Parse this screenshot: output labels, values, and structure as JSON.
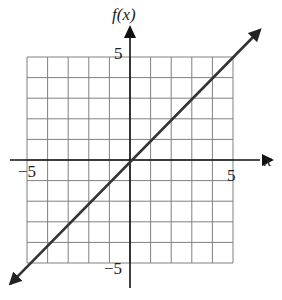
{
  "chart_data": {
    "type": "line",
    "title": "",
    "xlabel": "x",
    "ylabel": "f(x)",
    "xlim": [
      -5,
      5
    ],
    "ylim": [
      -5,
      5
    ],
    "grid": true,
    "grid_step": 1,
    "tick_labels": {
      "x": [
        "−5",
        "5"
      ],
      "y": [
        "5",
        "−5"
      ]
    },
    "series": [
      {
        "name": "f(x) = x",
        "equation": "f(x) = x",
        "x": [
          -5.8,
          -5,
          0,
          5,
          6.3
        ],
        "values": [
          -6.0,
          -5,
          0,
          5,
          6.3
        ],
        "arrows": "both"
      }
    ]
  },
  "colors": {
    "grid": "#777777",
    "axis": "#111111",
    "line": "#333333"
  }
}
